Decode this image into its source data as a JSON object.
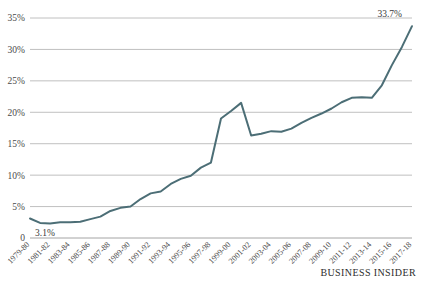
{
  "chart_data": {
    "type": "line",
    "title": "",
    "subtitle": "",
    "xlabel": "",
    "ylabel": "",
    "ylim": [
      0,
      35
    ],
    "grid": true,
    "legend_position": "none",
    "line_color": "#4c6e76",
    "categories": [
      "1979-80",
      "1980-81",
      "1981-82",
      "1982-83",
      "1983-84",
      "1984-85",
      "1985-86",
      "1986-87",
      "1987-88",
      "1988-89",
      "1989-90",
      "1990-91",
      "1991-92",
      "1992-93",
      "1993-94",
      "1994-95",
      "1995-96",
      "1996-97",
      "1997-98",
      "1998-99",
      "1999-00",
      "2000-01",
      "2001-02",
      "2002-03",
      "2003-04",
      "2004-05",
      "2005-06",
      "2006-07",
      "2007-08",
      "2008-09",
      "2009-10",
      "2010-11",
      "2011-12",
      "2012-13",
      "2013-14",
      "2014-15",
      "2015-16",
      "2016-17",
      "2017-18"
    ],
    "values": [
      3.1,
      2.4,
      2.3,
      2.5,
      2.5,
      2.6,
      3.0,
      3.4,
      4.3,
      4.8,
      5.0,
      6.2,
      7.1,
      7.4,
      8.6,
      9.4,
      9.9,
      11.2,
      12.0,
      19.0,
      20.2,
      21.5,
      16.3,
      16.6,
      17.0,
      16.9,
      17.4,
      18.3,
      19.1,
      19.8,
      20.6,
      21.6,
      22.3,
      22.4,
      22.3,
      24.3,
      27.5,
      30.4,
      33.7
    ],
    "xtick_labels": [
      "1979-80",
      "1981-82",
      "1983-84",
      "1985-86",
      "1987-88",
      "1989-90",
      "1991-92",
      "1993-94",
      "1995-96",
      "1997-98",
      "1999-00",
      "2001-02",
      "2003-04",
      "2005-06",
      "2007-08",
      "2009-10",
      "2011-12",
      "2013-14",
      "2015-16",
      "2017-18"
    ],
    "ytick_labels": [
      "0",
      "5%",
      "10%",
      "15%",
      "20%",
      "25%",
      "30%",
      "35%"
    ],
    "ytick_values": [
      0,
      5,
      10,
      15,
      20,
      25,
      30,
      35
    ],
    "annotations": [
      {
        "text": "3.1%",
        "value": 3.1,
        "position": "start"
      },
      {
        "text": "33.7%",
        "value": 33.7,
        "position": "end"
      }
    ]
  },
  "branding": {
    "label": "BUSINESS INSIDER"
  }
}
